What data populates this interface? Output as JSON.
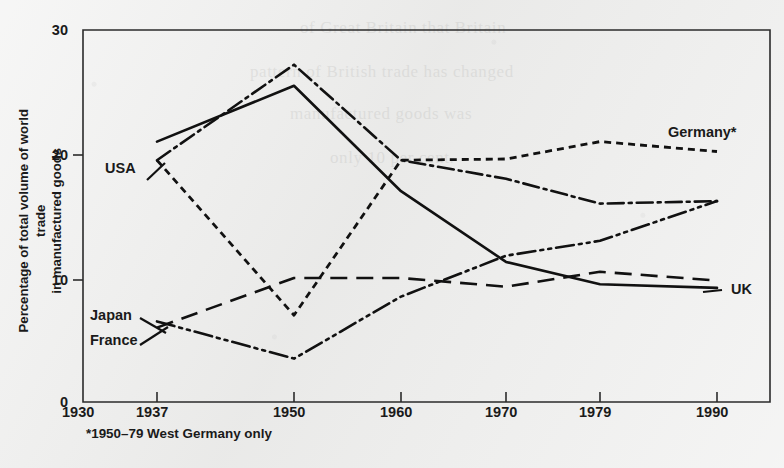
{
  "chart_data": {
    "type": "line",
    "title": "",
    "xlabel": "",
    "ylabel": "Percentage of total volume of world trade in manufactured goods",
    "x": [
      1937,
      1950,
      1960,
      1970,
      1979,
      1990
    ],
    "xlim": [
      1930,
      1994
    ],
    "ylim": [
      0,
      30
    ],
    "x_tick_labels": [
      "1930",
      "1937",
      "1950",
      "1960",
      "1970",
      "1979",
      "1990"
    ],
    "x_tick_values": [
      1930,
      1937,
      1950,
      1960,
      1970,
      1979,
      1990
    ],
    "y_tick_labels": [
      "0",
      "10",
      "20",
      "30"
    ],
    "y_tick_values": [
      0,
      10,
      20,
      30
    ],
    "grid": false,
    "legend_position": "inline-labels",
    "annotations": [
      "*1950–79 West Germany only"
    ],
    "series": [
      {
        "name": "USA",
        "label": "USA",
        "style": "solid",
        "values": [
          21.0,
          25.5,
          17.0,
          11.3,
          9.5,
          9.2
        ]
      },
      {
        "name": "UK",
        "label": "UK",
        "style": "dash-dot",
        "values": [
          19.5,
          27.2,
          19.5,
          18.0,
          16.0,
          16.2
        ]
      },
      {
        "name": "Germany",
        "label": "Germany*",
        "style": "dotted",
        "values": [
          19.5,
          7.0,
          19.5,
          19.6,
          21.0,
          20.2
        ]
      },
      {
        "name": "Japan",
        "label": "Japan",
        "style": "long-dash",
        "values": [
          6.0,
          10.0,
          10.0,
          9.3,
          10.5,
          9.8
        ]
      },
      {
        "name": "France",
        "label": "France",
        "style": "dash-dot-dot",
        "values": [
          6.5,
          3.5,
          8.5,
          11.8,
          13.0,
          16.2
        ]
      }
    ]
  },
  "axis": {
    "y_title": "Percentage of total volume of world trade in manufactured goods",
    "y_title_line1": "Percentage of total volume of world trade",
    "y_title_line2": "in manufactured goods",
    "y_ticks": [
      "30",
      "20",
      "10",
      "0"
    ],
    "x_ticks": [
      "1930",
      "1937",
      "1950",
      "1960",
      "1970",
      "1979",
      "1990"
    ]
  },
  "labels": {
    "usa": "USA",
    "uk": "UK",
    "germany": "Germany*",
    "japan": "Japan",
    "france": "France"
  },
  "footnote": "*1950–79 West Germany only",
  "colors": {
    "ink": "#111111",
    "paper": "#ececeb",
    "axis": "#2b2b2b"
  },
  "ghost_text": [
    "of Great Britain that Britain",
    "pattern of British trade has changed",
    "manufactured goods was",
    "only 10 per cent."
  ]
}
